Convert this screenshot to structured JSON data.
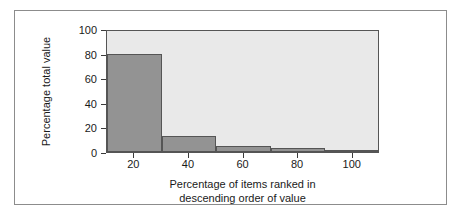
{
  "figure": {
    "frame_border_color": "#8c8c8c",
    "page_background": "#ffffff"
  },
  "chart_data": {
    "type": "bar",
    "title": "",
    "subtitle": "",
    "xlabel_line1": "Percentage of items ranked in",
    "xlabel_line2": "descending order of value",
    "ylabel": "Percentage total value",
    "xlim": [
      10,
      110
    ],
    "ylim": [
      0,
      100
    ],
    "grid": false,
    "legend": null,
    "xticks": [
      20,
      40,
      60,
      80,
      100
    ],
    "xtick_labels": [
      "20",
      "40",
      "60",
      "80",
      "100"
    ],
    "yticks": [
      0,
      20,
      40,
      60,
      80,
      100
    ],
    "ytick_labels": [
      "0",
      "20",
      "40",
      "60",
      "80",
      "100"
    ],
    "bar_fill_color": "#939393",
    "bar_edge_color": "#555555",
    "plot_background": "#e9e9e9",
    "axis_color": "#555555",
    "bin_edges": [
      10,
      30,
      50,
      70,
      90,
      110
    ],
    "categories": [
      "10-30",
      "30-50",
      "50-70",
      "70-90",
      "90-110"
    ],
    "values": [
      80,
      13,
      5,
      3,
      1
    ],
    "bars": [
      {
        "label": "10-30",
        "x_start": 10,
        "x_end": 30,
        "value": 80
      },
      {
        "label": "30-50",
        "x_start": 30,
        "x_end": 50,
        "value": 13
      },
      {
        "label": "50-70",
        "x_start": 50,
        "x_end": 70,
        "value": 5
      },
      {
        "label": "70-90",
        "x_start": 70,
        "x_end": 90,
        "value": 3
      },
      {
        "label": "90-110",
        "x_start": 90,
        "x_end": 110,
        "value": 1
      }
    ]
  }
}
